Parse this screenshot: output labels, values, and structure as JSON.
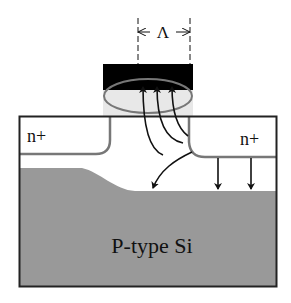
{
  "diagram": {
    "dimension_label": "Λ",
    "regions": {
      "source_label": "n+",
      "drain_label": "n+",
      "substrate_label": "P-type Si"
    },
    "colors": {
      "gate": "#000000",
      "gate_oxide": "#e6e6e6",
      "substrate": "#999999",
      "outline": "#222222",
      "junction": "#777777",
      "ellipse": "#777777",
      "arrows": "#111111"
    }
  }
}
